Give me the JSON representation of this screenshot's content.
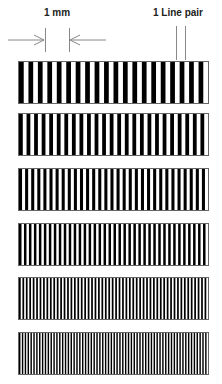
{
  "labels": {
    "scale": "1 mm",
    "line_pair": "1 Line pair"
  },
  "pattern": {
    "bar_color": "#000000",
    "space_color": "#ffffff",
    "blocks": [
      {
        "name": "block-1",
        "line_pairs": 20
      },
      {
        "name": "block-2",
        "line_pairs": 25
      },
      {
        "name": "block-3",
        "line_pairs": 31
      },
      {
        "name": "block-4",
        "line_pairs": 38
      },
      {
        "name": "block-5",
        "line_pairs": 55
      },
      {
        "name": "block-6",
        "line_pairs": 66
      }
    ]
  }
}
